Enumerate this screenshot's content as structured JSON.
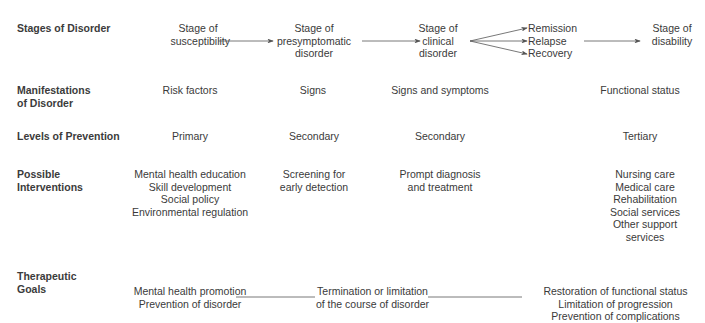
{
  "rows": {
    "stages": {
      "label": "Stages of Disorder",
      "items": [
        [
          "Stage of",
          "susceptibility"
        ],
        [
          "Stage of",
          "presymptomatic",
          "disorder"
        ],
        [
          "Stage of",
          "clinical",
          "disorder"
        ],
        [
          "Remission",
          "Relapse",
          "Recovery"
        ],
        [
          "Stage of",
          "disability"
        ]
      ]
    },
    "manifestations": {
      "label_lines": [
        "Manifestations",
        "of Disorder"
      ],
      "items": [
        "Risk factors",
        "Signs",
        "Signs and symptoms",
        "Functional status"
      ]
    },
    "prevention": {
      "label": "Levels of Prevention",
      "items": [
        "Primary",
        "Secondary",
        "Secondary",
        "Tertiary"
      ]
    },
    "interventions": {
      "label_lines": [
        "Possible",
        "Interventions"
      ],
      "items": [
        [
          "Mental health education",
          "Skill development",
          "Social policy",
          "Environmental regulation"
        ],
        [
          "Screening for",
          "early detection"
        ],
        [
          "Prompt diagnosis",
          "and treatment"
        ],
        [
          "Nursing care",
          "Medical care",
          "Rehabilitation",
          "Social services",
          "Other support",
          "services"
        ]
      ]
    },
    "goals": {
      "label_lines": [
        "Therapeutic",
        "Goals"
      ],
      "items": [
        [
          "Mental health promotion",
          "Prevention of disorder"
        ],
        [
          "Termination or limitation",
          "of the course of disorder"
        ],
        [
          "Restoration of functional status",
          "Limitation of progression",
          "Prevention of complications"
        ]
      ]
    }
  },
  "colors": {
    "text": "#3a3a3a",
    "line": "#555555"
  }
}
